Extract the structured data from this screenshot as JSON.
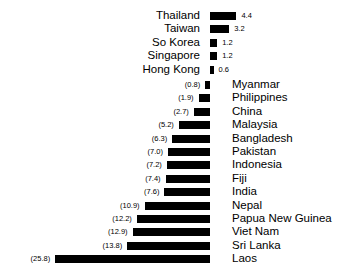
{
  "chart_data": {
    "type": "bar",
    "title": "",
    "subtitle": "",
    "xlabel": "",
    "ylabel": "",
    "orientation": "horizontal",
    "layout": "diverging-mirrored",
    "grid": false,
    "legend": null,
    "axis_origin_px": 210,
    "px_per_unit": 6.0,
    "value_label_style": {
      "upper_group": "plain",
      "lower_group": "parenthesized"
    },
    "groups": [
      {
        "name": "upper",
        "direction": "right",
        "label_side": "left",
        "categories": [
          "Thailand",
          "Taiwan",
          "So Korea",
          "Singapore",
          "Hong Kong"
        ],
        "values": [
          4.4,
          3.2,
          1.2,
          1.2,
          0.6
        ],
        "value_labels": [
          "4.4",
          "3.2",
          "1.2",
          "1.2",
          "0.6"
        ]
      },
      {
        "name": "lower",
        "direction": "left",
        "label_side": "right",
        "categories": [
          "Myanmar",
          "Philippines",
          "China",
          "Malaysia",
          "Bangladesh",
          "Pakistan",
          "Indonesia",
          "Fiji",
          "India",
          "Nepal",
          "Papua New Guinea",
          "Viet Nam",
          "Sri Lanka",
          "Laos"
        ],
        "values": [
          0.8,
          1.9,
          2.7,
          5.2,
          6.3,
          7.0,
          7.2,
          7.4,
          7.6,
          10.9,
          12.2,
          12.9,
          13.8,
          25.8
        ],
        "value_labels": [
          "(0.8)",
          "(1.9)",
          "(2.7)",
          "(5.2)",
          "(6.3)",
          "(7.0)",
          "(7.2)",
          "(7.4)",
          "(7.6)",
          "(10.9)",
          "(12.2)",
          "(12.9)",
          "(13.8)",
          "(25.8)"
        ]
      }
    ],
    "colors": {
      "bar": "#000000",
      "background": "#ffffff",
      "text": "#000000"
    }
  }
}
